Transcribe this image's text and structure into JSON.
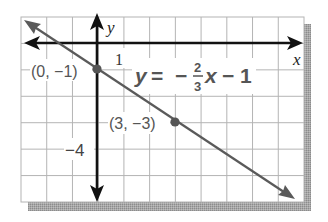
{
  "chart_data": {
    "type": "line",
    "title": "",
    "equation": {
      "lhs": "y",
      "eq": "=",
      "minus": "−",
      "frac_num": "2",
      "frac_den": "3",
      "var": "x",
      "tail": "− 1"
    },
    "series": [
      {
        "name": "y = -2/3 x - 1",
        "slope": -0.6667,
        "intercept": -1,
        "x": [
          -3,
          9
        ],
        "y": [
          1,
          -7
        ]
      }
    ],
    "points": [
      {
        "x": 0,
        "y": -1,
        "label": "(0, −1)"
      },
      {
        "x": 3,
        "y": -3,
        "label": "(3, −3)"
      }
    ],
    "xlabel": "x",
    "ylabel": "y",
    "tick_labels": {
      "x_one": "1",
      "y_minus_four": "−4"
    },
    "xlim": [
      -3,
      8
    ],
    "ylim": [
      -6,
      1
    ],
    "grid": true,
    "grid_step": 1,
    "colors": {
      "axis": "#111111",
      "line": "#5a5a5a",
      "grid": "#b4b4b4",
      "label": "#4a4a4a",
      "shadow": "#9a9a9a"
    }
  }
}
